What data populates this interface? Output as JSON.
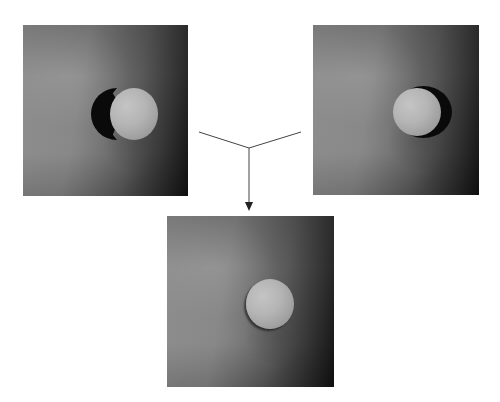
{
  "figure": {
    "panels": [
      {
        "id": "left",
        "label": "",
        "content": "sphere with jagged black shadow on left"
      },
      {
        "id": "right",
        "label": "",
        "content": "sphere with smooth black shadow on right"
      },
      {
        "id": "bottom",
        "label": "",
        "content": "combined result sphere with soft shadow"
      }
    ],
    "connectors": {
      "type": "merge-arrow",
      "from": [
        "left",
        "right"
      ],
      "to": "bottom",
      "color": "#333333"
    },
    "colors": {
      "background": "#ffffff",
      "panel_light": "#8f8f8f",
      "panel_dark": "#111111",
      "shadow": "#0a0a0a",
      "sphere": "#b5b5b5"
    }
  }
}
